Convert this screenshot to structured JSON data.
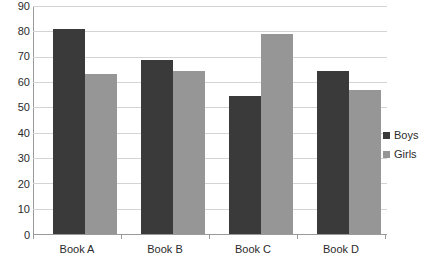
{
  "chart_data": {
    "type": "bar",
    "title": "",
    "subtitle": "",
    "xlabel": "",
    "ylabel": "",
    "categories": [
      "Book A",
      "Book B",
      "Book C",
      "Book D"
    ],
    "series": [
      {
        "name": "Boys",
        "color": "#3a3a3a",
        "values": [
          81,
          68.5,
          54.5,
          64.5
        ]
      },
      {
        "name": "Girls",
        "color": "#969696",
        "values": [
          63,
          64.5,
          79,
          57
        ]
      }
    ],
    "ylim": [
      0,
      90
    ],
    "ytick_step": 10,
    "ytick_labels": [
      "0",
      "10",
      "20",
      "30",
      "40",
      "50",
      "60",
      "70",
      "80",
      "90"
    ],
    "grid": true,
    "legend_position": "right",
    "legend_entries": [
      "Boys",
      "Girls"
    ],
    "background_color": "#ffffff",
    "gridline_color": "#d4d4d4",
    "axis_color": "#9a9a9a"
  }
}
